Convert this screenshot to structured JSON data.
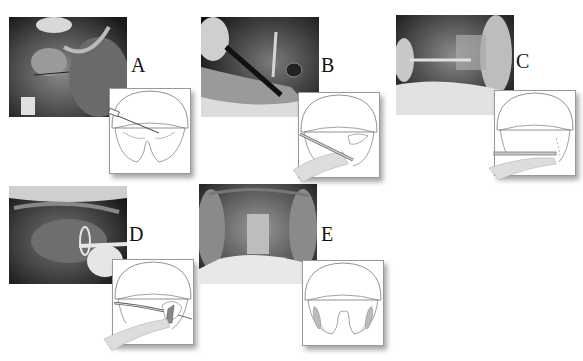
{
  "figure": {
    "panels": [
      {
        "id": "A",
        "label": "A",
        "photo": {
          "x": 9,
          "y": 17
        },
        "label_pos": {
          "x": 131,
          "y": 55
        },
        "diagram": {
          "x": 109,
          "y": 88
        },
        "step": "needle-injection"
      },
      {
        "id": "B",
        "label": "B",
        "photo": {
          "x": 201,
          "y": 17
        },
        "label_pos": {
          "x": 321,
          "y": 55
        },
        "diagram": {
          "x": 298,
          "y": 92
        },
        "step": "incision-with-instrument"
      },
      {
        "id": "C",
        "label": "C",
        "photo": {
          "x": 396,
          "y": 15
        },
        "label_pos": {
          "x": 516,
          "y": 51
        },
        "diagram": {
          "x": 494,
          "y": 90
        },
        "step": "dissection-with-rod"
      },
      {
        "id": "D",
        "label": "D",
        "photo": {
          "x": 9,
          "y": 186
        },
        "label_pos": {
          "x": 129,
          "y": 224
        },
        "diagram": {
          "x": 112,
          "y": 259
        },
        "step": "tonsil-removal-snare"
      },
      {
        "id": "E",
        "label": "E",
        "photo": {
          "x": 199,
          "y": 184
        },
        "label_pos": {
          "x": 321,
          "y": 224
        },
        "diagram": {
          "x": 302,
          "y": 260
        },
        "step": "final-result"
      }
    ]
  }
}
